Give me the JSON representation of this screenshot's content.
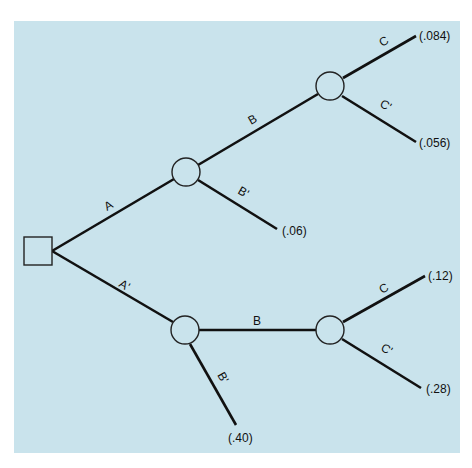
{
  "diagram": {
    "type": "decision-tree",
    "colors": {
      "background": "#c9e3ec",
      "line": "#111111"
    },
    "root": {
      "shape": "square"
    },
    "branches": {
      "A": "A",
      "A_prime": "A'",
      "upper_B": "B",
      "upper_B_prime": "B'",
      "upper_C": "C",
      "upper_C_prime": "C'",
      "lower_B": "B",
      "lower_B_prime": "B'",
      "lower_C": "C",
      "lower_C_prime": "C'"
    },
    "outcomes": {
      "A_B_C": "(.084)",
      "A_B_Cp": "(.056)",
      "A_Bp": "(.06)",
      "Ap_B_C": "(.12)",
      "Ap_B_Cp": "(.28)",
      "Ap_Bp": "(.40)"
    }
  }
}
